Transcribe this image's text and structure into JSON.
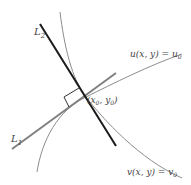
{
  "diagram": {
    "labels": {
      "L2": "L",
      "L2_sub": "2",
      "L1": "L",
      "L1_sub": "1",
      "u_curve": "u(x, y) = u",
      "u_sub": "0",
      "v_curve": "v(x, y) = v",
      "v_sub": "0",
      "point_open": "(x",
      "point_x_sub": "0",
      "point_mid": ", y",
      "point_y_sub": "0",
      "point_close": ")"
    },
    "colors": {
      "L2_line": "#1a1a1a",
      "L1_line": "#808080",
      "curves": "#8c8c8c",
      "text": "#444444"
    },
    "elements": [
      {
        "name": "L1",
        "type": "tangent-line",
        "description": "tangent to v(x,y)=v0 at (x0,y0)"
      },
      {
        "name": "L2",
        "type": "tangent-line",
        "description": "tangent to u(x,y)=u0 at (x0,y0)"
      },
      {
        "name": "u-level-curve",
        "type": "curve"
      },
      {
        "name": "v-level-curve",
        "type": "curve"
      },
      {
        "name": "right-angle-marker",
        "type": "marker"
      },
      {
        "name": "intersection-point",
        "type": "point",
        "label": "(x0, y0)"
      }
    ]
  }
}
